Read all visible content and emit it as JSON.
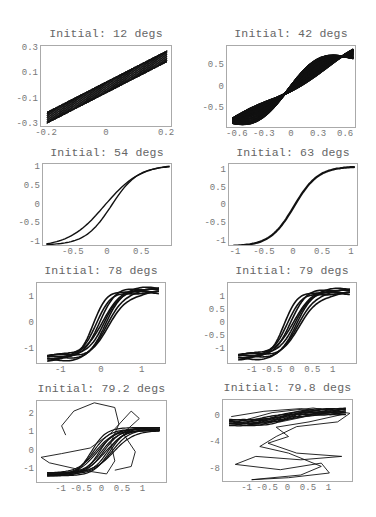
{
  "figure": {
    "background": "#ffffff",
    "line_color": "#111111",
    "frame_color": "#aaaaaa",
    "label_color": "#777777"
  },
  "panels": [
    {
      "title": "Initial: 12 degs",
      "frame": [
        40,
        45,
        132,
        82
      ],
      "title_y": 27,
      "xlim": [
        -0.22,
        0.22
      ],
      "ylim": [
        -0.32,
        0.32
      ],
      "xticks": [
        {
          "v": -0.2,
          "label": "-0.2"
        },
        {
          "v": 0,
          "label": "0"
        },
        {
          "v": 0.2,
          "label": "0.2"
        }
      ],
      "yticks": [
        {
          "v": 0.3,
          "label": "0.3"
        },
        {
          "v": 0.1,
          "label": "0.1"
        },
        {
          "v": -0.1,
          "label": "-0.1"
        },
        {
          "v": -0.3,
          "label": "-0.3"
        }
      ]
    },
    {
      "title": "Initial: 42 degs",
      "frame": [
        226,
        45,
        130,
        83
      ],
      "title_y": 27,
      "xlim": [
        -0.72,
        0.72
      ],
      "ylim": [
        -0.95,
        0.95
      ],
      "xticks": [
        {
          "v": -0.6,
          "label": "-0.6"
        },
        {
          "v": -0.3,
          "label": "-0.3"
        },
        {
          "v": 0,
          "label": "0"
        },
        {
          "v": 0.3,
          "label": "0.3"
        },
        {
          "v": 0.6,
          "label": "0.6"
        }
      ],
      "yticks": [
        {
          "v": 0.5,
          "label": "0.5"
        },
        {
          "v": 0,
          "label": "0"
        },
        {
          "v": -0.5,
          "label": "-0.5"
        }
      ]
    },
    {
      "title": "Initial: 54 degs",
      "frame": [
        42,
        163,
        130,
        83
      ],
      "title_y": 146,
      "xlim": [
        -0.95,
        0.95
      ],
      "ylim": [
        -1.1,
        1.1
      ],
      "xticks": [
        {
          "v": -0.5,
          "label": "-0.5"
        },
        {
          "v": 0,
          "label": "0"
        },
        {
          "v": 0.5,
          "label": "0.5"
        }
      ],
      "yticks": [
        {
          "v": 1,
          "label": "1"
        },
        {
          "v": 0.5,
          "label": "0.5"
        },
        {
          "v": 0,
          "label": "0"
        },
        {
          "v": -0.5,
          "label": "-0.5"
        },
        {
          "v": -1,
          "label": "-1"
        }
      ]
    },
    {
      "title": "Initial: 63 degs",
      "frame": [
        228,
        163,
        130,
        83
      ],
      "title_y": 146,
      "xlim": [
        -1.12,
        1.12
      ],
      "ylim": [
        -1.15,
        1.2
      ],
      "xticks": [
        {
          "v": -1,
          "label": "-1"
        },
        {
          "v": -0.5,
          "label": "-0.5"
        },
        {
          "v": 0,
          "label": "0"
        },
        {
          "v": 0.5,
          "label": "0.5"
        },
        {
          "v": 1,
          "label": "1"
        }
      ],
      "yticks": [
        {
          "v": 1,
          "label": "1"
        },
        {
          "v": 0.5,
          "label": "0.5"
        },
        {
          "v": 0,
          "label": "0"
        },
        {
          "v": -0.5,
          "label": "-0.5"
        },
        {
          "v": -1,
          "label": "-1"
        }
      ]
    },
    {
      "title": "Initial: 78 degs",
      "frame": [
        36,
        282,
        130,
        82
      ],
      "title_y": 264,
      "xlim": [
        -1.6,
        1.6
      ],
      "ylim": [
        -1.55,
        1.55
      ],
      "xticks": [
        {
          "v": -1,
          "label": "-1"
        },
        {
          "v": 0,
          "label": "0"
        },
        {
          "v": 1,
          "label": "1"
        }
      ],
      "yticks": [
        {
          "v": 1,
          "label": "1"
        },
        {
          "v": 0,
          "label": "0"
        },
        {
          "v": -1,
          "label": "-1"
        }
      ]
    },
    {
      "title": "Initial: 79 degs",
      "frame": [
        227,
        282,
        130,
        82
      ],
      "title_y": 264,
      "xlim": [
        -1.6,
        1.6
      ],
      "ylim": [
        -1.6,
        1.6
      ],
      "xticks": [
        {
          "v": -1,
          "label": "-1"
        },
        {
          "v": -0.5,
          "label": "-0.5"
        },
        {
          "v": 0,
          "label": "0"
        },
        {
          "v": 0.5,
          "label": "0.5"
        },
        {
          "v": 1,
          "label": "1"
        }
      ],
      "yticks": [
        {
          "v": 1,
          "label": "1"
        },
        {
          "v": 0.5,
          "label": "0.5"
        },
        {
          "v": 0,
          "label": "0"
        },
        {
          "v": -0.5,
          "label": "-0.5"
        },
        {
          "v": -1,
          "label": "-1"
        }
      ]
    },
    {
      "title": "Initial: 79.2 degs",
      "frame": [
        36,
        400,
        131,
        83
      ],
      "title_y": 382,
      "xlim": [
        -1.6,
        1.6
      ],
      "ylim": [
        -1.75,
        2.75
      ],
      "xticks": [
        {
          "v": -1,
          "label": "-1"
        },
        {
          "v": -0.5,
          "label": "-0.5"
        },
        {
          "v": 0,
          "label": "0"
        },
        {
          "v": 0.5,
          "label": "0.5"
        },
        {
          "v": 1,
          "label": "1"
        }
      ],
      "yticks": [
        {
          "v": 2,
          "label": "2"
        },
        {
          "v": 1,
          "label": "1"
        },
        {
          "v": 0,
          "label": "0"
        },
        {
          "v": -1,
          "label": "-1"
        }
      ]
    },
    {
      "title": "Initial: 79.8 degs",
      "frame": [
        222,
        399,
        131,
        83
      ],
      "title_y": 381,
      "xlim": [
        -1.6,
        1.6
      ],
      "ylim": [
        -10,
        2.5
      ],
      "xticks": [
        {
          "v": -1,
          "label": "-1"
        },
        {
          "v": -0.5,
          "label": "-0.5"
        },
        {
          "v": 0,
          "label": "0"
        },
        {
          "v": 0.5,
          "label": "0.5"
        },
        {
          "v": 1,
          "label": "1"
        }
      ],
      "yticks": [
        {
          "v": 0,
          "label": "0"
        },
        {
          "v": -4,
          "label": "-4"
        },
        {
          "v": -8,
          "label": "-8"
        }
      ]
    }
  ],
  "chart_data": [
    {
      "type": "line",
      "title": "Initial: 12 degs",
      "xlabel": "",
      "ylabel": "",
      "xlim": [
        -0.22,
        0.22
      ],
      "ylim": [
        -0.32,
        0.32
      ],
      "grid": false,
      "description": "Dense parallelogram band of oscillation from (-0.2,-0.25) to (0.2,0.25)",
      "band_half_width": 0.045,
      "slope": 1.2
    },
    {
      "type": "line",
      "title": "Initial: 42 degs",
      "xlim": [
        -0.72,
        0.72
      ],
      "ylim": [
        -0.95,
        0.95
      ],
      "grid": false,
      "description": "Thick S-shaped band with two lens-shaped holes, from (-0.65,-0.8) to (0.68,0.8)"
    },
    {
      "type": "line",
      "title": "Initial: 54 degs",
      "xlim": [
        -0.95,
        0.95
      ],
      "ylim": [
        -1.1,
        1.1
      ],
      "grid": false,
      "series": [
        {
          "name": "branch1",
          "x": [
            -0.9,
            -0.5,
            -0.2,
            0,
            0.3,
            0.6,
            0.9
          ],
          "y": [
            -0.98,
            -0.75,
            -0.38,
            0.05,
            0.55,
            0.88,
            1.05
          ]
        },
        {
          "name": "branch2",
          "x": [
            -0.9,
            -0.5,
            -0.2,
            0,
            0.3,
            0.6,
            0.9
          ],
          "y": [
            -1.03,
            -0.85,
            -0.38,
            -0.15,
            0.4,
            0.85,
            0.95
          ]
        }
      ]
    },
    {
      "type": "line",
      "title": "Initial: 63 degs",
      "xlim": [
        -1.12,
        1.12
      ],
      "ylim": [
        -1.15,
        1.2
      ],
      "grid": false,
      "series": [
        {
          "name": "curve",
          "x": [
            -1.05,
            -0.5,
            -0.2,
            0,
            0.2,
            0.5,
            1.05
          ],
          "y": [
            -1.1,
            -0.9,
            -0.55,
            0,
            0.6,
            0.95,
            1.12
          ]
        }
      ]
    },
    {
      "type": "line",
      "title": "Initial: 78 degs",
      "xlim": [
        -1.6,
        1.6
      ],
      "ylim": [
        -1.55,
        1.55
      ],
      "grid": false,
      "description": "Several interleaved sigmoid loops, y from about -1.4 to 1.5"
    },
    {
      "type": "line",
      "title": "Initial: 79 degs",
      "xlim": [
        -1.6,
        1.6
      ],
      "ylim": [
        -1.6,
        1.6
      ],
      "grid": false,
      "description": "Several interleaved sigmoid loops, slightly broader than 78 degs"
    },
    {
      "type": "line",
      "title": "Initial: 79.2 degs",
      "xlim": [
        -1.6,
        1.6
      ],
      "ylim": [
        -1.75,
        2.75
      ],
      "grid": false,
      "description": "Sigmoid loops with chaotic excursion up to y~2.7"
    },
    {
      "type": "line",
      "title": "Initial: 79.8 degs",
      "xlim": [
        -1.6,
        1.6
      ],
      "ylim": [
        -10,
        2.5
      ],
      "grid": false,
      "description": "Horizontal band near y=0 plus large chaotic loops down to y~-9.5"
    }
  ]
}
